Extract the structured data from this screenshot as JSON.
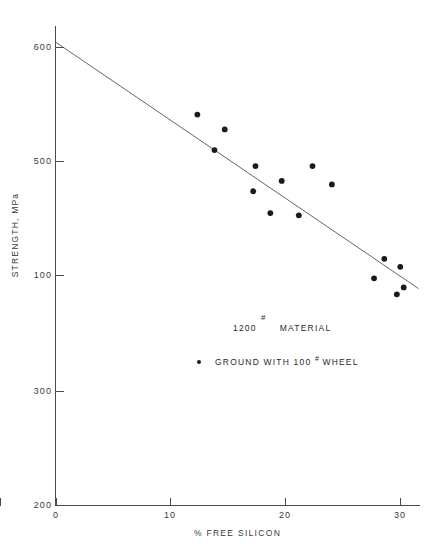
{
  "chart_data": {
    "type": "scatter",
    "title": "",
    "xlabel": "% FREE SILICON",
    "ylabel": "STRENGTH, MPa",
    "xlim": [
      0,
      32
    ],
    "ylim": [
      200,
      620
    ],
    "xticks": [
      "0",
      "10",
      "20",
      "30"
    ],
    "xtick_values": [
      0,
      10,
      20,
      30
    ],
    "yticks": [
      "200",
      "300",
      "100",
      "500",
      "600"
    ],
    "ytick_values": [
      200,
      300,
      400,
      500,
      600
    ],
    "grid": false,
    "legend_position": "center",
    "series": [
      {
        "name": "GROUND WITH 100 # WHEEL",
        "marker": "filled-circle",
        "color": "#1a1a1a",
        "points": [
          {
            "x": 12.4,
            "y": 541
          },
          {
            "x": 14.8,
            "y": 528
          },
          {
            "x": 13.9,
            "y": 510
          },
          {
            "x": 17.5,
            "y": 496
          },
          {
            "x": 17.3,
            "y": 474
          },
          {
            "x": 18.8,
            "y": 455
          },
          {
            "x": 19.8,
            "y": 483
          },
          {
            "x": 21.3,
            "y": 453
          },
          {
            "x": 22.5,
            "y": 496
          },
          {
            "x": 24.2,
            "y": 480
          },
          {
            "x": 27.9,
            "y": 398
          },
          {
            "x": 28.8,
            "y": 415
          },
          {
            "x": 30.2,
            "y": 408
          },
          {
            "x": 30.5,
            "y": 390
          },
          {
            "x": 29.9,
            "y": 384
          }
        ]
      }
    ],
    "fit_line": {
      "name": "linear regression trend",
      "color": "#555555",
      "x_start": 0.0,
      "y_start": 604,
      "x_end": 31.8,
      "y_end": 389
    },
    "annotations": [
      {
        "text": "1200",
        "role": "material-label"
      },
      {
        "text": "#",
        "role": "material-grit-superscript"
      },
      {
        "text": "MATERIAL",
        "role": "material-heading"
      },
      {
        "text": "GROUND WITH 100",
        "role": "legend-text-prefix"
      },
      {
        "text": "#",
        "role": "legend-grit-superscript"
      },
      {
        "text": "WHEEL",
        "role": "legend-text-suffix"
      }
    ]
  },
  "axes": {
    "y_title": "STRENGTH, MPa",
    "x_title": "% FREE SILICON",
    "y_tick_labels": [
      {
        "text": "600",
        "top": 42
      },
      {
        "text": "500",
        "top": 156
      },
      {
        "text": "100",
        "top": 270
      },
      {
        "text": "300",
        "top": 386
      },
      {
        "text": "200",
        "top": 500
      }
    ],
    "x_tick_labels": [
      {
        "text": "0",
        "left": 42
      },
      {
        "text": "10",
        "left": 155
      },
      {
        "text": "20",
        "left": 270
      },
      {
        "text": "30",
        "left": 385
      }
    ]
  },
  "legend": {
    "material_value": "1200",
    "material_grit": "#",
    "material_word": "MATERIAL",
    "ground_prefix": "GROUND WITH 100",
    "ground_grit": "#",
    "ground_suffix": "WHEEL"
  }
}
